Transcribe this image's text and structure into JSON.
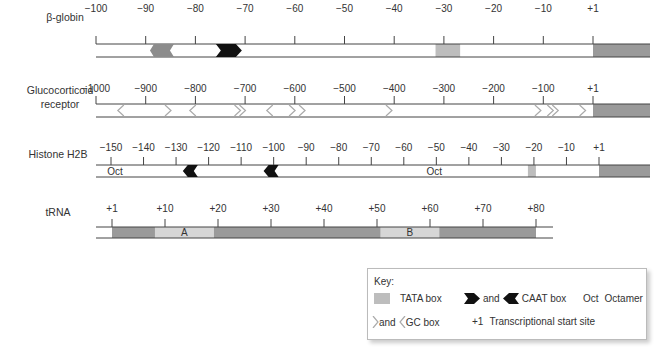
{
  "colors": {
    "tata": "#bdbdbd",
    "downstream": "#9a9a9a",
    "gc_filled": "#8c8c8c",
    "caat": "#111111",
    "box_ab": "#d6d6d6",
    "line": "#444444",
    "gc_outline": "#aaaaaa"
  },
  "tracks": [
    {
      "id": "beta-globin",
      "label": [
        "β-globin"
      ],
      "ticks": [
        "−100",
        "−90",
        "−80",
        "−70",
        "−60",
        "−50",
        "−40",
        "−30",
        "−20",
        "−10",
        "+1"
      ],
      "tata": [
        {
          "from": -31,
          "to": -26
        }
      ],
      "caat": [
        {
          "dir": "right",
          "at": -73
        }
      ],
      "gc": [
        {
          "dir": "left",
          "at": -87,
          "filled": true
        }
      ],
      "downstream": true
    },
    {
      "id": "glucocorticoid-receptor",
      "label": [
        "Glucocorticoid",
        "receptor"
      ],
      "ticks": [
        "−1000",
        "−900",
        "−800",
        "−700",
        "−600",
        "−500",
        "−400",
        "−300",
        "−200",
        "−100",
        "+1"
      ],
      "gc": [
        {
          "dir": "left",
          "at": -950
        },
        {
          "dir": "right",
          "at": -855
        },
        {
          "dir": "left",
          "at": -805
        },
        {
          "dir": "right",
          "at": -715
        },
        {
          "dir": "right",
          "at": -705
        },
        {
          "dir": "left",
          "at": -650
        },
        {
          "dir": "right",
          "at": -605
        },
        {
          "dir": "right",
          "at": -585
        },
        {
          "dir": "right",
          "at": -410
        },
        {
          "dir": "right",
          "at": -110
        },
        {
          "dir": "right",
          "at": -85
        },
        {
          "dir": "right",
          "at": -75
        },
        {
          "dir": "right",
          "at": -20
        }
      ],
      "downstream": true
    },
    {
      "id": "histone-h2b",
      "label": [
        "Histone H2B"
      ],
      "ticks": [
        "−150",
        "−140",
        "−130",
        "−120",
        "−110",
        "−100",
        "−90",
        "−80",
        "−70",
        "−60",
        "−50",
        "−40",
        "−30",
        "−20",
        "−10",
        "+1"
      ],
      "oct": [
        {
          "at": -150,
          "text": "Oct"
        },
        {
          "at": -50,
          "text": "Oct"
        }
      ],
      "caat": [
        {
          "dir": "left",
          "at": -125
        },
        {
          "dir": "left",
          "at": -100
        }
      ],
      "tata": [
        {
          "from": -21,
          "to": -19
        }
      ],
      "downstream": true
    },
    {
      "id": "trna",
      "label": [
        "tRNA"
      ],
      "ticks": [
        "+1",
        "+10",
        "+20",
        "+30",
        "+40",
        "+50",
        "+60",
        "+70",
        "+80"
      ],
      "boxes": [
        {
          "name": "A",
          "from": 9,
          "to": 20
        },
        {
          "name": "B",
          "from": 51,
          "to": 62
        }
      ]
    }
  ],
  "key": {
    "title": "Key:",
    "tata": "TATA box",
    "and1": "and",
    "caat": "CAAT box",
    "oct_abbr": "Oct",
    "oct": "Octamer",
    "and2": "and",
    "gc": "GC box",
    "plus1": "+1",
    "tss": "Transcriptional start site"
  }
}
